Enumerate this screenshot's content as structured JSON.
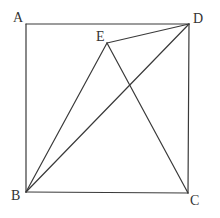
{
  "figure": {
    "type": "geometry-diagram",
    "colors": {
      "background": "#ffffff",
      "stroke": "#3a3a3a",
      "label": "#333333"
    },
    "points": {
      "A": {
        "label": "A",
        "x": 26,
        "y": 24
      },
      "B": {
        "label": "B",
        "x": 26,
        "y": 192
      },
      "C": {
        "label": "C",
        "x": 188,
        "y": 193
      },
      "D": {
        "label": "D",
        "x": 189,
        "y": 24
      },
      "E": {
        "label": "E",
        "x": 107,
        "y": 43
      }
    },
    "segments": [
      {
        "from": "A",
        "to": "D"
      },
      {
        "from": "D",
        "to": "C"
      },
      {
        "from": "C",
        "to": "B"
      },
      {
        "from": "B",
        "to": "A"
      },
      {
        "from": "E",
        "to": "B"
      },
      {
        "from": "E",
        "to": "C"
      },
      {
        "from": "E",
        "to": "D"
      },
      {
        "from": "B",
        "to": "D"
      }
    ]
  }
}
